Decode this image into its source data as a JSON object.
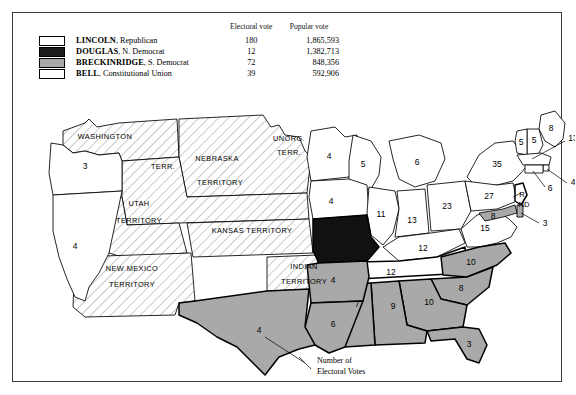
{
  "legend": {
    "header": {
      "electoral": "Electoral vote",
      "popular": "Popular vote"
    },
    "rows": [
      {
        "key": "lincoln",
        "candidate": "LINCOLN",
        "party": ", Republican",
        "electoral": "180",
        "popular": "1,865,593",
        "swatch": "hatch-white",
        "color": "#ffffff"
      },
      {
        "key": "douglas",
        "candidate": "DOUGLAS",
        "party": ", N. Democrat",
        "electoral": "12",
        "popular": "1,382,713",
        "swatch": "solid-black",
        "color": "#1c1c1c"
      },
      {
        "key": "breckinridge",
        "candidate": "BRECKINRIDGE",
        "party": ", S. Democrat",
        "electoral": "72",
        "popular": "848,356",
        "swatch": "solid-gray",
        "color": "#a9a9a9"
      },
      {
        "key": "bell",
        "candidate": "BELL",
        "party": ", Constitutional Union",
        "electoral": "39",
        "popular": "592,906",
        "swatch": "solid-white",
        "color": "#ffffff"
      }
    ]
  },
  "annotation": {
    "line1": "Number of",
    "line2": "Electoral Votes"
  },
  "territories": [
    {
      "id": "washington",
      "label": "WASHINGTON",
      "x": 78,
      "y": 38
    },
    {
      "id": "nebraska",
      "label": "NEBRASKA",
      "x": 190,
      "y": 60
    },
    {
      "id": "nebraska2",
      "label": "TERRITORY",
      "x": 193,
      "y": 84
    },
    {
      "id": "unorg",
      "label": "UNORG.",
      "x": 262,
      "y": 40
    },
    {
      "id": "unorg2",
      "label": "TERR.",
      "x": 262,
      "y": 54
    },
    {
      "id": "terr-dakota",
      "label": "TERR.",
      "x": 136,
      "y": 68
    },
    {
      "id": "utah",
      "label": "UTAH",
      "x": 112,
      "y": 105
    },
    {
      "id": "utah2",
      "label": "TERRITORY",
      "x": 112,
      "y": 122
    },
    {
      "id": "kansas",
      "label": "KANSAS TERRITORY",
      "x": 225,
      "y": 132
    },
    {
      "id": "newmexico",
      "label": "NEW MEXICO",
      "x": 105,
      "y": 170
    },
    {
      "id": "newmexico2",
      "label": "TERRITORY",
      "x": 105,
      "y": 186
    },
    {
      "id": "indian",
      "label": "INDIAN",
      "x": 277,
      "y": 168
    },
    {
      "id": "indian2",
      "label": "TERRITORY",
      "x": 277,
      "y": 183
    }
  ],
  "states": [
    {
      "id": "oregon",
      "name": "Oregon",
      "votes": "3",
      "winner": "lincoln",
      "x": 58,
      "y": 65
    },
    {
      "id": "california",
      "name": "California",
      "votes": "4",
      "winner": "lincoln",
      "x": 48,
      "y": 145
    },
    {
      "id": "minnesota",
      "name": "Minnesota",
      "votes": "4",
      "winner": "lincoln",
      "x": 300,
      "y": 55
    },
    {
      "id": "iowa",
      "name": "Iowa",
      "votes": "4",
      "winner": "lincoln",
      "x": 300,
      "y": 100
    },
    {
      "id": "wisconsin",
      "name": "Wisconsin",
      "votes": "5",
      "winner": "lincoln",
      "x": 334,
      "y": 58
    },
    {
      "id": "michigan",
      "name": "Michigan",
      "votes": "6",
      "winner": "lincoln",
      "x": 390,
      "y": 62
    },
    {
      "id": "illinois",
      "name": "Illinois",
      "votes": "11",
      "winner": "lincoln",
      "x": 352,
      "y": 113
    },
    {
      "id": "indiana",
      "name": "Indiana",
      "votes": "13",
      "winner": "lincoln",
      "x": 385,
      "y": 120
    },
    {
      "id": "ohio",
      "name": "Ohio",
      "votes": "23",
      "winner": "lincoln",
      "x": 422,
      "y": 105
    },
    {
      "id": "kentucky",
      "name": "Kentucky",
      "votes": "12",
      "winner": "bell",
      "x": 392,
      "y": 148
    },
    {
      "id": "missouri",
      "name": "Missouri",
      "votes": "",
      "winner": "douglas",
      "x": 322,
      "y": 140
    },
    {
      "id": "tennessee",
      "name": "Tennessee",
      "votes": "12",
      "winner": "bell",
      "x": 380,
      "y": 172
    },
    {
      "id": "virginia",
      "name": "Virginia",
      "votes": "15",
      "winner": "bell",
      "x": 444,
      "y": 130
    },
    {
      "id": "newyork",
      "name": "New York",
      "votes": "35",
      "winner": "lincoln",
      "x": 477,
      "y": 57
    },
    {
      "id": "pennsylvania",
      "name": "Pennsylvania",
      "votes": "27",
      "winner": "lincoln",
      "x": 463,
      "y": 96
    },
    {
      "id": "maine",
      "name": "Maine",
      "votes": "8",
      "winner": "lincoln",
      "x": 525,
      "y": 25
    },
    {
      "id": "newhampshire",
      "name": "New Hampshire",
      "votes": "5",
      "winner": "lincoln",
      "x": 494,
      "y": 42
    },
    {
      "id": "vermont",
      "name": "Vermont",
      "votes": "5",
      "winner": "lincoln",
      "x": 509,
      "y": 50
    },
    {
      "id": "massachusetts",
      "name": "Massachusetts",
      "votes": "13",
      "winner": "lincoln",
      "x": 556,
      "y": 38
    },
    {
      "id": "rhodeisland",
      "name": "Rhode Island",
      "votes": "4",
      "winner": "lincoln",
      "x": 554,
      "y": 73
    },
    {
      "id": "connecticut",
      "name": "Connecticut",
      "votes": "6",
      "winner": "lincoln",
      "x": 525,
      "y": 82
    },
    {
      "id": "newjersey",
      "name": "New Jersey",
      "votes": "R",
      "winner": "split",
      "x": 492,
      "y": 92
    },
    {
      "id": "maryland",
      "name": "Maryland",
      "votes": "8",
      "winner": "breckinridge",
      "x": 466,
      "y": 118
    },
    {
      "id": "delaware",
      "name": "Delaware",
      "votes": "3",
      "winner": "breckinridge",
      "x": 512,
      "y": 120
    },
    {
      "id": "northcarolina",
      "name": "North Carolina",
      "votes": "10",
      "winner": "breckinridge",
      "x": 440,
      "y": 163
    },
    {
      "id": "southcarolina",
      "name": "South Carolina",
      "votes": "8",
      "winner": "breckinridge",
      "x": 430,
      "y": 193
    },
    {
      "id": "georgia",
      "name": "Georgia",
      "votes": "10",
      "winner": "breckinridge",
      "x": 398,
      "y": 198
    },
    {
      "id": "florida",
      "name": "Florida",
      "votes": "3",
      "winner": "breckinridge",
      "x": 425,
      "y": 240
    },
    {
      "id": "alabama",
      "name": "Alabama",
      "votes": "9",
      "winner": "breckinridge",
      "x": 362,
      "y": 200
    },
    {
      "id": "mississippi",
      "name": "Mississippi",
      "votes": "7",
      "winner": "breckinridge",
      "x": 330,
      "y": 203
    },
    {
      "id": "arkansas",
      "name": "Arkansas",
      "votes": "4",
      "winner": "breckinridge",
      "x": 298,
      "y": 182
    },
    {
      "id": "louisiana",
      "name": "Louisiana",
      "votes": "6",
      "winner": "breckinridge",
      "x": 303,
      "y": 224
    },
    {
      "id": "texas",
      "name": "Texas",
      "votes": "4",
      "winner": "breckinridge",
      "x": 232,
      "y": 232
    }
  ],
  "labels": {
    "nj_r": "R",
    "nj_nd": "ND"
  }
}
